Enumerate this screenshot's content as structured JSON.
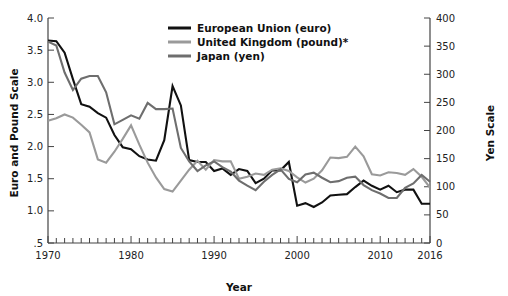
{
  "chart_data": {
    "type": "line",
    "title": "",
    "xlabel": "Year",
    "ylabel": "Euro and Pound Scale",
    "ylabel_right": "Yen Scale",
    "xlim": [
      1970,
      2016
    ],
    "ylim": [
      0.5,
      4.0
    ],
    "ylim_right": [
      0,
      400
    ],
    "grid": false,
    "legend_position": "top-center",
    "x_ticks_major": [
      "1970",
      "1980",
      "1990",
      "2000",
      "2010",
      "2016"
    ],
    "x_tick_values": [
      1970,
      1980,
      1990,
      2000,
      2010,
      2016
    ],
    "x_minor_tick_step": 1,
    "y_ticks_left": [
      ".5",
      "1.0",
      "1.5",
      "2.0",
      "2.5",
      "3.0",
      "3.5",
      "4.0"
    ],
    "y_tick_values_left": [
      0.5,
      1.0,
      1.5,
      2.0,
      2.5,
      3.0,
      3.5,
      4.0
    ],
    "y_ticks_right": [
      "0",
      "50",
      "100",
      "150",
      "200",
      "250",
      "300",
      "350",
      "400"
    ],
    "y_tick_values_right": [
      0,
      50,
      100,
      150,
      200,
      250,
      300,
      350,
      400
    ],
    "x": [
      1970,
      1971,
      1972,
      1973,
      1974,
      1975,
      1976,
      1977,
      1978,
      1979,
      1980,
      1981,
      1982,
      1983,
      1984,
      1985,
      1986,
      1987,
      1988,
      1989,
      1990,
      1991,
      1992,
      1993,
      1994,
      1995,
      1996,
      1997,
      1998,
      1999,
      2000,
      2001,
      2002,
      2003,
      2004,
      2005,
      2006,
      2007,
      2008,
      2009,
      2010,
      2011,
      2012,
      2013,
      2014,
      2015,
      2016
    ],
    "series": [
      {
        "name": "European Union (euro)",
        "axis": "left",
        "color": "#111111",
        "unit": "euro per US dollar (index scale)",
        "values": [
          3.65,
          3.64,
          3.46,
          3.05,
          2.66,
          2.62,
          2.52,
          2.45,
          2.18,
          1.99,
          1.96,
          1.85,
          1.8,
          1.78,
          2.1,
          2.94,
          2.64,
          1.79,
          1.76,
          1.76,
          1.62,
          1.66,
          1.56,
          1.65,
          1.62,
          1.43,
          1.5,
          1.63,
          1.63,
          1.76,
          1.08,
          1.12,
          1.06,
          1.13,
          1.24,
          1.25,
          1.26,
          1.37,
          1.47,
          1.39,
          1.33,
          1.39,
          1.29,
          1.33,
          1.33,
          1.11,
          1.11
        ]
      },
      {
        "name": "United Kingdom (pound)*",
        "axis": "left",
        "color": "#9a9a9a",
        "unit": "US dollars per pound",
        "values": [
          2.4,
          2.44,
          2.5,
          2.45,
          2.34,
          2.22,
          1.8,
          1.75,
          1.92,
          2.12,
          2.33,
          2.03,
          1.75,
          1.52,
          1.34,
          1.3,
          1.47,
          1.64,
          1.78,
          1.64,
          1.79,
          1.77,
          1.77,
          1.5,
          1.53,
          1.58,
          1.56,
          1.64,
          1.66,
          1.62,
          1.52,
          1.44,
          1.5,
          1.63,
          1.83,
          1.82,
          1.84,
          2.0,
          1.85,
          1.57,
          1.55,
          1.6,
          1.59,
          1.56,
          1.65,
          1.53,
          1.36
        ]
      },
      {
        "name": "Japan (yen)",
        "axis": "right",
        "color": "#6e6e6e",
        "unit": "yen per US dollar",
        "values": [
          358,
          351,
          303,
          272,
          292,
          297,
          297,
          268,
          211,
          219,
          227,
          221,
          249,
          238,
          238,
          239,
          169,
          145,
          128,
          138,
          145,
          135,
          127,
          111,
          102,
          94,
          109,
          121,
          131,
          114,
          108,
          122,
          125,
          116,
          108,
          110,
          116,
          118,
          103,
          94,
          88,
          80,
          80,
          98,
          106,
          121,
          109
        ]
      }
    ]
  },
  "legend": {
    "items": [
      {
        "label": "European Union (euro)",
        "color": "#111111"
      },
      {
        "label": "United Kingdom (pound)*",
        "color": "#9a9a9a"
      },
      {
        "label": "Japan (yen)",
        "color": "#6e6e6e"
      }
    ]
  },
  "axes": {
    "left_title": "Euro and Pound Scale",
    "right_title": "Yen Scale",
    "bottom_title": "Year"
  }
}
